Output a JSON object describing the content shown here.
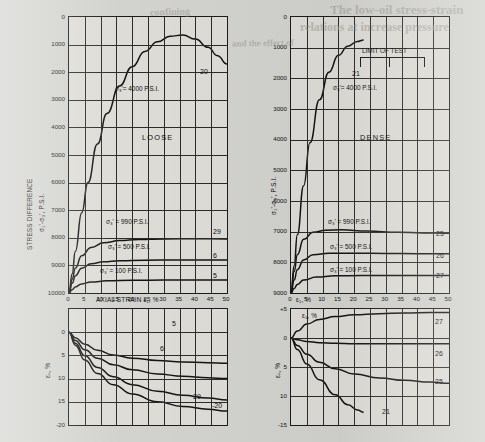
{
  "page": {
    "background_color": "#d2d2ce",
    "ink_color": "#141414",
    "bleed_through_text": [
      "The low-oil stress-strain",
      "relations at increase pressure",
      "and the effect of",
      "confining"
    ]
  },
  "chart_data": [
    {
      "id": "loose-stress-strain",
      "type": "line",
      "title": "LOOSE",
      "xlabel": "AXIAL STRAIN  ε₁, %",
      "ylabel": "STRESS DIFFERENCE   σ₁'-σ₃', P.S.I.",
      "xlim": [
        0,
        50
      ],
      "ylim": [
        0,
        10000
      ],
      "xticks": [
        0,
        5,
        10,
        15,
        20,
        25,
        30,
        35,
        40,
        45,
        50
      ],
      "xtick_labels": [
        "0",
        "5",
        "10",
        "15",
        "20",
        "25",
        "30",
        "35",
        "40",
        "45",
        "50"
      ],
      "yticks": [
        0,
        1000,
        2000,
        3000,
        4000,
        5000,
        6000,
        7000,
        8000,
        9000,
        10000
      ],
      "ytick_labels": [
        "0",
        "1000",
        "2000",
        "3000",
        "4000",
        "5000",
        "6000",
        "7000",
        "8000",
        "9000",
        "10000"
      ],
      "grid": true,
      "series": [
        {
          "name": "20",
          "annotation": "σ₃' = 4000 P.S.I.",
          "curve_label": "20",
          "x": [
            0,
            1,
            2,
            4,
            6,
            9,
            12,
            16,
            20,
            24,
            28,
            32,
            36,
            40,
            44,
            47,
            50
          ],
          "y": [
            0,
            700,
            1500,
            2900,
            4000,
            5400,
            6500,
            7500,
            8200,
            8750,
            9100,
            9300,
            9350,
            9200,
            8900,
            8600,
            8300
          ]
        },
        {
          "name": "29",
          "annotation": "σ₃' = 990 P.S.I.",
          "curve_label": "29",
          "x": [
            0,
            1,
            2,
            4,
            7,
            11,
            16,
            22,
            30,
            40,
            50
          ],
          "y": [
            0,
            500,
            900,
            1350,
            1650,
            1820,
            1900,
            1940,
            1960,
            1965,
            1960
          ]
        },
        {
          "name": "6",
          "annotation": "σ₃' = 500 P.S.I.",
          "curve_label": "6",
          "x": [
            0,
            1,
            2,
            4,
            7,
            11,
            16,
            24,
            34,
            44,
            50
          ],
          "y": [
            0,
            350,
            620,
            900,
            1060,
            1130,
            1170,
            1190,
            1200,
            1200,
            1200
          ]
        },
        {
          "name": "5",
          "annotation": "σ₃' = 100 P.S.I.",
          "curve_label": "5",
          "x": [
            0,
            1,
            2,
            4,
            7,
            12,
            20,
            30,
            40,
            50
          ],
          "y": [
            0,
            120,
            220,
            330,
            400,
            440,
            460,
            470,
            470,
            470
          ]
        }
      ]
    },
    {
      "id": "dense-stress-strain",
      "type": "line",
      "title": "DENSE",
      "xlabel": "ε₁, %",
      "ylabel": "σ₁'-σ₃', P.S.I.",
      "xlim": [
        0,
        50
      ],
      "ylim": [
        0,
        9000
      ],
      "xticks": [
        0,
        5,
        10,
        15,
        20,
        25,
        30,
        35,
        40,
        45,
        50
      ],
      "xtick_labels": [
        "0",
        "5",
        "10",
        "15",
        "20",
        "25",
        "30",
        "35",
        "40",
        "45",
        "50"
      ],
      "yticks": [
        0,
        1000,
        2000,
        3000,
        4000,
        5000,
        6000,
        7000,
        8000,
        9000
      ],
      "ytick_labels": [
        "0",
        "1000",
        "2000",
        "3000",
        "4000",
        "5000",
        "6000",
        "7000",
        "8000",
        "9000"
      ],
      "grid": true,
      "annotations": [
        "LIMIT OF TEST"
      ],
      "series": [
        {
          "name": "21",
          "annotation": "σ₃' = 4000 P.S.I.",
          "curve_label": "21",
          "x": [
            0,
            1,
            2,
            4,
            6,
            9,
            12,
            15,
            18,
            21,
            23
          ],
          "y": [
            0,
            900,
            1900,
            3500,
            4900,
            6300,
            7200,
            7750,
            8050,
            8200,
            8250
          ]
        },
        {
          "name": "25",
          "annotation": "σ₃' = 990 P.S.I.",
          "curve_label": "25",
          "x": [
            0,
            1,
            2,
            4,
            7,
            11,
            16,
            24,
            34,
            42,
            50
          ],
          "y": [
            0,
            700,
            1250,
            1750,
            1980,
            2050,
            2060,
            2020,
            1980,
            1960,
            1950
          ]
        },
        {
          "name": "26",
          "annotation": "σ₃' = 500 P.S.I.",
          "curve_label": "26",
          "x": [
            0,
            1,
            2,
            4,
            7,
            12,
            20,
            30,
            40,
            50
          ],
          "y": [
            0,
            420,
            760,
            1080,
            1250,
            1300,
            1300,
            1290,
            1280,
            1280
          ]
        },
        {
          "name": "27",
          "annotation": "σ₃' = 100 P.S.I.",
          "curve_label": "27",
          "x": [
            0,
            1,
            2,
            4,
            8,
            14,
            22,
            32,
            42,
            50
          ],
          "y": [
            0,
            150,
            280,
            420,
            520,
            560,
            570,
            570,
            570,
            570
          ]
        }
      ]
    },
    {
      "id": "loose-volumetric-strain",
      "type": "line",
      "xlabel": "",
      "ylabel": "εᵥ, %",
      "xlim": [
        0,
        50
      ],
      "ylim": [
        -20,
        5
      ],
      "xticks": [
        0,
        5,
        10,
        15,
        20,
        25,
        30,
        35,
        40,
        45,
        50
      ],
      "yticks": [
        5,
        0,
        -5,
        -10,
        -15,
        -20
      ],
      "ytick_labels": [
        "",
        "0",
        "5",
        "10",
        "15",
        "-20"
      ],
      "grid": true,
      "series": [
        {
          "name": "5",
          "curve_label": "5",
          "x": [
            0,
            2,
            5,
            9,
            14,
            20,
            28,
            36,
            44,
            50
          ],
          "y": [
            0,
            -1.2,
            -2.6,
            -3.9,
            -4.9,
            -5.6,
            -6.1,
            -6.4,
            -6.6,
            -6.7
          ]
        },
        {
          "name": "6",
          "curve_label": "6",
          "x": [
            0,
            2,
            5,
            9,
            14,
            20,
            28,
            36,
            44,
            50
          ],
          "y": [
            0,
            -1.8,
            -3.8,
            -5.6,
            -7.0,
            -8.1,
            -9.0,
            -9.5,
            -9.8,
            -10.0
          ]
        },
        {
          "name": "29",
          "curve_label": "29",
          "x": [
            0,
            2,
            5,
            9,
            14,
            20,
            28,
            36,
            44,
            50
          ],
          "y": [
            0,
            -2.4,
            -5.1,
            -7.6,
            -9.6,
            -11.3,
            -12.7,
            -13.6,
            -14.2,
            -14.6
          ]
        },
        {
          "name": "20",
          "curve_label": "20",
          "x": [
            0,
            2,
            5,
            9,
            14,
            20,
            28,
            36,
            44,
            50
          ],
          "y": [
            0,
            -2.8,
            -6.0,
            -8.9,
            -11.3,
            -13.3,
            -15.0,
            -16.0,
            -16.6,
            -17.0
          ]
        }
      ]
    },
    {
      "id": "dense-volumetric-strain",
      "type": "line",
      "xlabel": "ε₁, %",
      "ylabel": "εᵥ, %",
      "xlim": [
        0,
        50
      ],
      "ylim": [
        -15,
        5
      ],
      "xticks": [
        0,
        5,
        10,
        15,
        20,
        25,
        30,
        35,
        40,
        45,
        50
      ],
      "yticks": [
        5,
        0,
        -5,
        -10,
        -15
      ],
      "ytick_labels": [
        "+5",
        "0",
        "5",
        "10",
        "-15"
      ],
      "grid": true,
      "series": [
        {
          "name": "27",
          "curve_label": "27",
          "x": [
            0,
            2,
            5,
            9,
            14,
            20,
            28,
            36,
            44,
            50
          ],
          "y": [
            0,
            1.2,
            2.4,
            3.2,
            3.7,
            4.0,
            4.2,
            4.3,
            4.4,
            4.4
          ]
        },
        {
          "name": "26",
          "curve_label": "26",
          "x": [
            0,
            2,
            5,
            9,
            14,
            20,
            28,
            36,
            44,
            50
          ],
          "y": [
            0,
            -0.3,
            -0.6,
            -0.8,
            -0.9,
            -1.0,
            -1.0,
            -1.0,
            -1.0,
            -1.0
          ]
        },
        {
          "name": "25",
          "curve_label": "25",
          "x": [
            0,
            2,
            5,
            9,
            14,
            20,
            28,
            36,
            44,
            50
          ],
          "y": [
            0,
            -1.3,
            -2.8,
            -4.2,
            -5.3,
            -6.2,
            -6.9,
            -7.3,
            -7.6,
            -7.8
          ]
        },
        {
          "name": "21",
          "curve_label": "21",
          "x": [
            0,
            2,
            5,
            9,
            14,
            18,
            21,
            23
          ],
          "y": [
            0,
            -2.0,
            -4.5,
            -7.2,
            -9.8,
            -11.5,
            -12.4,
            -12.8
          ]
        }
      ]
    }
  ],
  "labels": {
    "loose": "LOOSE",
    "dense": "DENSE",
    "limit_of_test": "LIMIT OF TEST",
    "axial_strain": "AXIAL STRAIN  ε₁, %",
    "stress_difference": "STRESS DIFFERENCE",
    "stress_symbol": "σ₁'-σ₃', P.S.I.",
    "eps_v": "εᵥ, %",
    "eps_1": "ε₁, %",
    "sigma_4000": "σ₃'= 4000 P.S.I.",
    "sigma_990": "σ₃' = 990 P.S.I.",
    "sigma_500": "σ₃' = 500 P.S.I.",
    "sigma_100": "σ₃' = 100 P.S.I.",
    "n5": "5",
    "n6": "6",
    "n20": "20",
    "n21": "21",
    "n25": "25",
    "n26": "26",
    "n27": "27",
    "n29": "29",
    "n20b": "-20"
  }
}
